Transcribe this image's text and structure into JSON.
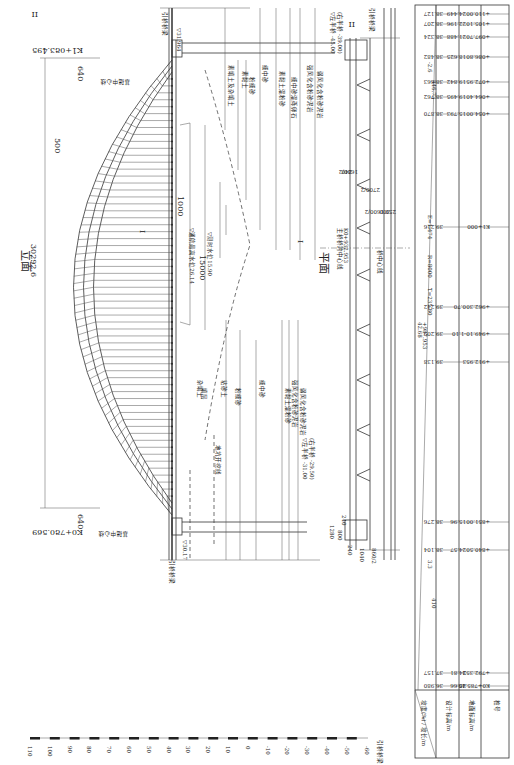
{
  "elevation": {
    "title": "立面",
    "section_mark": "I",
    "section_mark_top": "II",
    "span_total": "30292.6",
    "rib_spacing": "500",
    "end_left_station": "K0+780.569",
    "end_right_station": "K1+083.495",
    "abutment_offset": "640",
    "abutment_offset_right": "640",
    "foundation_centerline": "基础中心线",
    "approach_bridge": "引桥桥梁",
    "level_left": "▽30.17",
    "level_right": "▽31.964",
    "navigation_width": "15000",
    "clearance": "1000",
    "high_water_level": "▽通航最高水位26.14",
    "measured_water_level": "▽测时水位15.90",
    "pile_left_top": "▽左半桥 -31.00",
    "pile_left_bottom": "(右半桥 -29.50)",
    "pile_right_top": "▽左半桥 -45.00",
    "pile_right_bottom": "(右半桥 -39.00)",
    "soil_layers_left": [
      "杂填土",
      "填层",
      "粘砂土",
      "粉细砂",
      "细中砂",
      "素黏土混粉砂",
      "强风化含粉砂泥岩",
      "弱风化含粉砂泥岩"
    ],
    "soil_layers_right": [
      "素填土及杂填土",
      "素黏土",
      "粉细砂",
      "细中砂",
      "素黏土混粉砂",
      "细中砂混砾卵石",
      "强风化含粉砂泥岩",
      "弱风化含粉砂泥岩"
    ],
    "excavation_line": "地坑开挖线"
  },
  "plan": {
    "title": "平面",
    "section_mark": "I",
    "section_mark_top": "II",
    "main_centerline": "主桥桥跨中心线",
    "main_centerline_station": "K0+932.953",
    "bridge_centerline": "桥中心线",
    "approach_bridge": "引桥桥梁",
    "dims_left": [
      "240",
      "800",
      "240",
      "1280",
      "1040",
      "860/2"
    ],
    "dims_right": [
      "240",
      "1600/2",
      "2700/2",
      "1600/2",
      "300",
      "250"
    ]
  },
  "profile_table": {
    "row_labels": [
      "坡度(%) / 坡长/m",
      "设计标高/m",
      "地面标高/m",
      "桩号"
    ],
    "grade_left": "3.3",
    "grade_left_length": "410",
    "grade_right": "-2.6",
    "grade_right_length": "446.73",
    "curve": {
      "R": "R=8000",
      "E": "E=1.474",
      "T": "T=235.80"
    },
    "curve_pi_station": "+987.953",
    "curve_pi_elev": "42.68",
    "stations": [
      {
        "station": "K0+785.40",
        "ground": "25.66",
        "design": "36.980"
      },
      {
        "station": "+792.353",
        "ground": "24.81",
        "design": "37.157"
      },
      {
        "station": "+840.50",
        "ground": "24.57",
        "design": "38.104"
      },
      {
        "station": "+851.00",
        "ground": "15.96",
        "design": "38.276"
      },
      {
        "station": "+912.953",
        "ground": "",
        "design": "39.138"
      },
      {
        "station": "+949.10",
        "ground": "-1.10",
        "design": "39.209"
      },
      {
        "station": "+962.30",
        "ground": "0.70",
        "design": "39.242"
      },
      {
        "station": "K1+000",
        "ground": "",
        "design": "39.216"
      },
      {
        "station": "+054.00",
        "ground": "15.793",
        "design": "38.870"
      },
      {
        "station": "+064.40",
        "ground": "19.495",
        "design": "38.762"
      },
      {
        "station": "+072.95",
        "ground": "19.842",
        "design": "38.663"
      },
      {
        "station": "+086.80",
        "ground": "18.625",
        "design": "38.482"
      },
      {
        "station": "+097.70",
        "ground": "21.488",
        "design": "38.324"
      },
      {
        "station": "+105.10",
        "ground": "22.196",
        "design": "38.207"
      },
      {
        "station": "+110.00",
        "ground": "24.449",
        "design": "38.127"
      }
    ]
  },
  "elevation_scale": {
    "ticks": [
      "110",
      "100",
      "90",
      "80",
      "70",
      "60",
      "50",
      "40",
      "30",
      "20",
      "10",
      "0",
      "-10",
      "-20",
      "-30",
      "-40",
      "-50",
      "-60"
    ]
  }
}
